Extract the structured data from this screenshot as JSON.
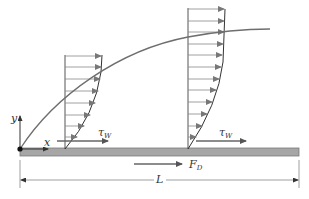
{
  "colors": {
    "plate_fill": "#a6a6a6",
    "plate_edge": "#7a7a7a",
    "lines": "#555555",
    "arrows": "#777777",
    "curve": "#6e6e6e",
    "text": "#333333"
  },
  "labels": {
    "y_axis": "y",
    "x_axis": "x",
    "tau_w_1": "τ",
    "tau_w_1_sub": "W",
    "tau_w_2": "τ",
    "tau_w_2_sub": "W",
    "drag_force": "F",
    "drag_force_sub": "D",
    "length": "L"
  },
  "profiles": [
    {
      "name": "upstream-velocity-profile",
      "x": 65,
      "top": 55,
      "bottom": 149,
      "arrow_count": 8
    },
    {
      "name": "downstream-velocity-profile",
      "x": 188,
      "top": 8,
      "bottom": 149,
      "arrow_count": 12
    }
  ]
}
